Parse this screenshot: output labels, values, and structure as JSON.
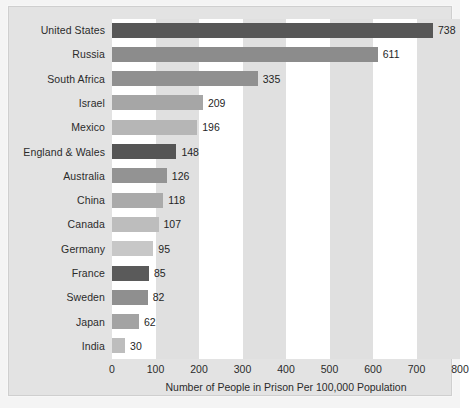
{
  "chart_data": {
    "type": "bar",
    "orientation": "horizontal",
    "title": "",
    "xlabel": "Number of People in Prison Per 100,000 Population",
    "ylabel": "",
    "xlim": [
      0,
      800
    ],
    "xticks": [
      0,
      100,
      200,
      300,
      400,
      500,
      600,
      700,
      800
    ],
    "grid": false,
    "banding": "alternating vertical bands every 100 units",
    "legend": "none",
    "categories": [
      "United States",
      "Russia",
      "South Africa",
      "Israel",
      "Mexico",
      "England & Wales",
      "Australia",
      "China",
      "Canada",
      "Germany",
      "France",
      "Sweden",
      "Japan",
      "India"
    ],
    "values": [
      738,
      611,
      335,
      209,
      196,
      148,
      126,
      118,
      107,
      95,
      85,
      82,
      62,
      30
    ],
    "value_labels": [
      "738",
      "611",
      "335",
      "209",
      "196",
      "148",
      "126",
      "118",
      "107",
      "95",
      "85",
      "82",
      "62",
      "30"
    ],
    "bar_colors": [
      "#575757",
      "#8c8c8c",
      "#909090",
      "#a6a6a6",
      "#b6b6b6",
      "#555555",
      "#939393",
      "#aaaaaa",
      "#bdbdbd",
      "#c7c7c7",
      "#5a5a5a",
      "#8f8f8f",
      "#a3a3a3",
      "#bdbdbd"
    ]
  },
  "colors": {
    "page_background": "#f4f4f4",
    "plate_background": "#e3e3e3",
    "plate_border": "#cfcfcf",
    "band_light": "#ffffff",
    "band_dark": "#e0e0e0",
    "text": "#2b2b2b"
  }
}
